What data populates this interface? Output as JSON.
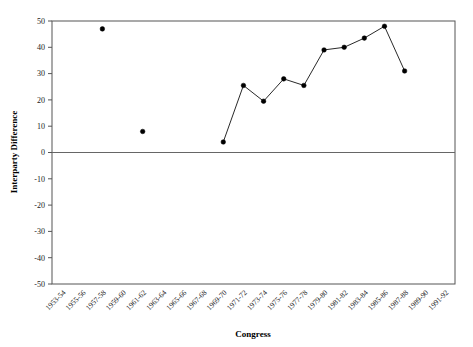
{
  "chart_data": {
    "type": "line",
    "title": "",
    "xlabel": "Congress",
    "ylabel": "Interparty Difference",
    "ylim": [
      -50,
      50
    ],
    "yticks": [
      50,
      40,
      30,
      20,
      10,
      0,
      -10,
      -20,
      -30,
      -40,
      -50
    ],
    "ytick_labels": [
      "50",
      "40",
      "30",
      "20",
      "10",
      "0",
      "-10",
      "-20",
      "-30",
      "-40",
      "-50"
    ],
    "grid": false,
    "legend": "none",
    "zero_line": 0,
    "categories": [
      "1953-54",
      "1955-56",
      "1957-58",
      "1959-60",
      "1961-62",
      "1963-64",
      "1965-66",
      "1967-68",
      "1969-70",
      "1971-72",
      "1973-74",
      "1975-76",
      "1977-78",
      "1979-80",
      "1981-82",
      "1983-84",
      "1985-86",
      "1987-88",
      "1989-90",
      "1991-92"
    ],
    "series": [
      {
        "name": "isolated-points",
        "connected": false,
        "points": [
          {
            "category": "1957-58",
            "value": 47
          },
          {
            "category": "1961-62",
            "value": 8
          }
        ]
      },
      {
        "name": "connected-series",
        "connected": true,
        "points": [
          {
            "category": "1969-70",
            "value": 4
          },
          {
            "category": "1971-72",
            "value": 25.5
          },
          {
            "category": "1973-74",
            "value": 19.5
          },
          {
            "category": "1975-76",
            "value": 28
          },
          {
            "category": "1977-78",
            "value": 25.5
          },
          {
            "category": "1979-80",
            "value": 39
          },
          {
            "category": "1981-82",
            "value": 40
          },
          {
            "category": "1983-84",
            "value": 43.5
          },
          {
            "category": "1985-86",
            "value": 48
          },
          {
            "category": "1987-88",
            "value": 31
          }
        ]
      }
    ]
  }
}
